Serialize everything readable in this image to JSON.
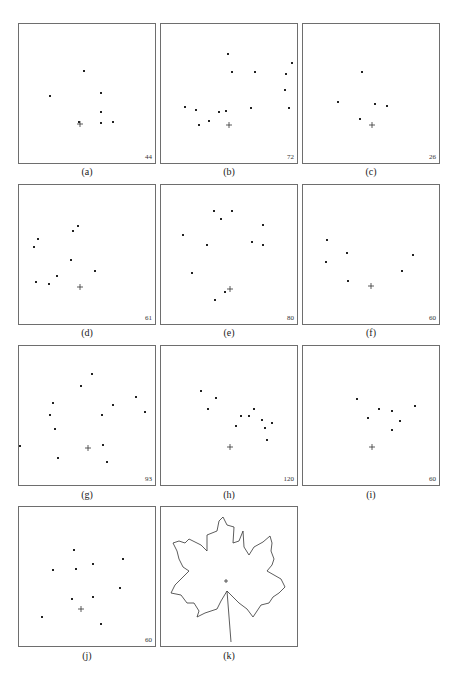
{
  "figure": {
    "panels": [
      {
        "id": "a",
        "label": "(a)",
        "count": "44",
        "center": [
          61,
          100
        ],
        "points": [
          [
            65,
            47
          ],
          [
            82,
            69
          ],
          [
            31,
            72
          ],
          [
            82,
            88
          ],
          [
            60,
            98
          ],
          [
            82,
            99
          ],
          [
            94,
            98
          ]
        ]
      },
      {
        "id": "b",
        "label": "(b)",
        "count": "72",
        "center": [
          68,
          101
        ],
        "points": [
          [
            67,
            30
          ],
          [
            71,
            48
          ],
          [
            94,
            48
          ],
          [
            125,
            50
          ],
          [
            131,
            39
          ],
          [
            124,
            66
          ],
          [
            24,
            83
          ],
          [
            35,
            86
          ],
          [
            128,
            84
          ],
          [
            90,
            84
          ],
          [
            38,
            101
          ],
          [
            48,
            97
          ],
          [
            58,
            88
          ],
          [
            65,
            87
          ]
        ]
      },
      {
        "id": "c",
        "label": "(c)",
        "count": "26",
        "center": [
          69,
          101
        ],
        "points": [
          [
            59,
            48
          ],
          [
            35,
            78
          ],
          [
            72,
            80
          ],
          [
            84,
            82
          ],
          [
            57,
            95
          ]
        ]
      },
      {
        "id": "d",
        "label": "(d)",
        "count": "61",
        "center": [
          61,
          102
        ],
        "points": [
          [
            59,
            41
          ],
          [
            54,
            46
          ],
          [
            19,
            54
          ],
          [
            15,
            62
          ],
          [
            52,
            75
          ],
          [
            76,
            86
          ],
          [
            38,
            91
          ],
          [
            17,
            97
          ],
          [
            30,
            99
          ]
        ]
      },
      {
        "id": "e",
        "label": "(e)",
        "count": "80",
        "center": [
          69,
          104
        ],
        "points": [
          [
            53,
            26
          ],
          [
            71,
            26
          ],
          [
            60,
            34
          ],
          [
            102,
            40
          ],
          [
            22,
            50
          ],
          [
            46,
            60
          ],
          [
            91,
            57
          ],
          [
            102,
            60
          ],
          [
            31,
            88
          ],
          [
            64,
            107
          ],
          [
            54,
            115
          ]
        ]
      },
      {
        "id": "f",
        "label": "(f)",
        "count": "60",
        "center": [
          68,
          101
        ],
        "points": [
          [
            24,
            55
          ],
          [
            44,
            68
          ],
          [
            110,
            70
          ],
          [
            23,
            77
          ],
          [
            99,
            86
          ],
          [
            45,
            96
          ]
        ]
      },
      {
        "id": "g",
        "label": "(g)",
        "count": "93",
        "center": [
          69,
          102
        ],
        "points": [
          [
            73,
            28
          ],
          [
            62,
            40
          ],
          [
            117,
            51
          ],
          [
            34,
            57
          ],
          [
            94,
            59
          ],
          [
            126,
            66
          ],
          [
            31,
            69
          ],
          [
            83,
            69
          ],
          [
            36,
            83
          ],
          [
            1,
            100
          ],
          [
            84,
            99
          ],
          [
            39,
            112
          ],
          [
            88,
            116
          ]
        ]
      },
      {
        "id": "h",
        "label": "(h)",
        "count": "120",
        "center": [
          69,
          101
        ],
        "points": [
          [
            40,
            45
          ],
          [
            55,
            52
          ],
          [
            47,
            63
          ],
          [
            93,
            63
          ],
          [
            80,
            70
          ],
          [
            88,
            70
          ],
          [
            101,
            74
          ],
          [
            111,
            77
          ],
          [
            75,
            80
          ],
          [
            104,
            82
          ],
          [
            106,
            94
          ]
        ]
      },
      {
        "id": "i",
        "label": "(i)",
        "count": "60",
        "center": [
          69,
          101
        ],
        "points": [
          [
            54,
            53
          ],
          [
            112,
            60
          ],
          [
            76,
            63
          ],
          [
            89,
            65
          ],
          [
            65,
            72
          ],
          [
            97,
            75
          ],
          [
            89,
            84
          ]
        ]
      },
      {
        "id": "j",
        "label": "(j)",
        "count": "60",
        "center": [
          62,
          102
        ],
        "points": [
          [
            55,
            43
          ],
          [
            104,
            52
          ],
          [
            74,
            57
          ],
          [
            34,
            63
          ],
          [
            57,
            62
          ],
          [
            101,
            81
          ],
          [
            53,
            92
          ],
          [
            74,
            90
          ],
          [
            23,
            110
          ],
          [
            82,
            117
          ]
        ]
      }
    ],
    "outline_panel": {
      "id": "k",
      "label": "(k)"
    }
  }
}
